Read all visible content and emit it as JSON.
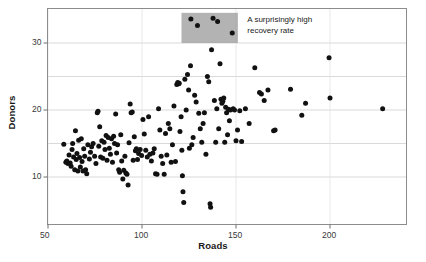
{
  "chart_data": {
    "type": "scatter",
    "title": "",
    "xlabel": "Roads",
    "ylabel": "Donors",
    "xlim": [
      48,
      238
    ],
    "ylim": [
      5,
      34.5
    ],
    "xticks": [
      50,
      100,
      150,
      200
    ],
    "yticks": [
      10,
      20,
      30
    ],
    "gridlines_y": [
      10,
      15,
      20,
      25,
      30
    ],
    "grid": true,
    "legend": "none",
    "marker_color": "#111111",
    "marker_size": 2.5,
    "annotations": [
      {
        "name": "highlight-band",
        "type": "rect",
        "x0": 121,
        "x1": 151,
        "y0": 30,
        "y1": 34.5,
        "fill": "#9a9a9a",
        "opacity": 0.75
      },
      {
        "name": "highlight-note",
        "type": "text",
        "line1": "A surprisingly high",
        "line2": "recovery rate",
        "x": 156,
        "y": 33.6
      }
    ],
    "points": [
      [
        58.4,
        14.9
      ],
      [
        59.5,
        12.2
      ],
      [
        60.0,
        12.4
      ],
      [
        60.6,
        12.0
      ],
      [
        61.2,
        13.3
      ],
      [
        61.8,
        12.1
      ],
      [
        62.3,
        11.6
      ],
      [
        62.8,
        14.1
      ],
      [
        63.1,
        15.0
      ],
      [
        63.6,
        13.0
      ],
      [
        64.2,
        11.1
      ],
      [
        64.6,
        16.9
      ],
      [
        65.0,
        12.6
      ],
      [
        65.4,
        13.5
      ],
      [
        65.9,
        10.9
      ],
      [
        66.3,
        15.5
      ],
      [
        66.8,
        12.9
      ],
      [
        67.2,
        11.5
      ],
      [
        67.7,
        15.7
      ],
      [
        68.1,
        12.3
      ],
      [
        68.6,
        10.9
      ],
      [
        69.0,
        14.2
      ],
      [
        69.5,
        13.1
      ],
      [
        70.0,
        11.1
      ],
      [
        70.6,
        10.5
      ],
      [
        71.2,
        14.8
      ],
      [
        72.0,
        12.7
      ],
      [
        72.6,
        13.7
      ],
      [
        73.2,
        14.5
      ],
      [
        74.0,
        15.0
      ],
      [
        74.8,
        13.1
      ],
      [
        75.5,
        12.0
      ],
      [
        76.2,
        19.6
      ],
      [
        76.6,
        19.8
      ],
      [
        77.0,
        14.6
      ],
      [
        77.5,
        17.5
      ],
      [
        78.0,
        13.0
      ],
      [
        78.6,
        15.4
      ],
      [
        79.2,
        12.8
      ],
      [
        79.8,
        15.2
      ],
      [
        80.3,
        14.1
      ],
      [
        80.9,
        16.2
      ],
      [
        81.4,
        12.5
      ],
      [
        82.0,
        15.9
      ],
      [
        82.6,
        14.3
      ],
      [
        83.2,
        13.4
      ],
      [
        83.8,
        15.7
      ],
      [
        84.3,
        12.2
      ],
      [
        84.9,
        16.1
      ],
      [
        85.4,
        15.0
      ],
      [
        86.0,
        19.4
      ],
      [
        86.5,
        13.6
      ],
      [
        87.0,
        14.8
      ],
      [
        87.6,
        11.1
      ],
      [
        88.1,
        10.7
      ],
      [
        88.7,
        16.3
      ],
      [
        89.2,
        12.4
      ],
      [
        89.8,
        9.7
      ],
      [
        90.3,
        11.0
      ],
      [
        90.9,
        13.1
      ],
      [
        91.4,
        10.6
      ],
      [
        92.0,
        10.4
      ],
      [
        92.6,
        8.8
      ],
      [
        93.1,
        15.1
      ],
      [
        93.7,
        20.9
      ],
      [
        94.2,
        19.6
      ],
      [
        94.8,
        19.7
      ],
      [
        95.3,
        12.5
      ],
      [
        95.9,
        16.0
      ],
      [
        96.5,
        13.9
      ],
      [
        97.0,
        14.2
      ],
      [
        97.6,
        12.6
      ],
      [
        98.2,
        13.5
      ],
      [
        99.0,
        14.1
      ],
      [
        99.8,
        13.2
      ],
      [
        100.5,
        18.6
      ],
      [
        101.2,
        16.4
      ],
      [
        102.0,
        14.0
      ],
      [
        102.8,
        13.0
      ],
      [
        103.5,
        19.0
      ],
      [
        104.2,
        13.4
      ],
      [
        105.0,
        12.4
      ],
      [
        105.8,
        13.6
      ],
      [
        106.5,
        14.2
      ],
      [
        107.2,
        10.5
      ],
      [
        108.0,
        10.4
      ],
      [
        108.8,
        20.2
      ],
      [
        109.5,
        17.0
      ],
      [
        110.2,
        13.1
      ],
      [
        111.0,
        12.0
      ],
      [
        111.8,
        10.4
      ],
      [
        112.5,
        16.5
      ],
      [
        113.2,
        13.3
      ],
      [
        114.0,
        18.0
      ],
      [
        114.8,
        17.2
      ],
      [
        115.5,
        12.2
      ],
      [
        116.2,
        14.8
      ],
      [
        117.0,
        20.6
      ],
      [
        117.8,
        12.3
      ],
      [
        118.5,
        23.8
      ],
      [
        119.0,
        24.1
      ],
      [
        119.5,
        23.9
      ],
      [
        119.8,
        24.0
      ],
      [
        120.2,
        16.8
      ],
      [
        120.8,
        19.0
      ],
      [
        121.2,
        14.0
      ],
      [
        121.5,
        10.2
      ],
      [
        121.8,
        7.8
      ],
      [
        122.2,
        6.2
      ],
      [
        122.8,
        24.6
      ],
      [
        123.5,
        20.0
      ],
      [
        124.2,
        25.3
      ],
      [
        124.8,
        23.0
      ],
      [
        125.2,
        14.3
      ],
      [
        125.8,
        26.6
      ],
      [
        126.0,
        33.6
      ],
      [
        126.5,
        14.8
      ],
      [
        127.2,
        15.9
      ],
      [
        128.0,
        22.2
      ],
      [
        128.8,
        21.2
      ],
      [
        129.5,
        32.6
      ],
      [
        130.2,
        19.5
      ],
      [
        131.0,
        17.2
      ],
      [
        131.8,
        15.2
      ],
      [
        132.5,
        18.0
      ],
      [
        133.2,
        19.6
      ],
      [
        134.0,
        13.4
      ],
      [
        134.8,
        25.0
      ],
      [
        135.5,
        24.2
      ],
      [
        136.2,
        6.0
      ],
      [
        136.5,
        5.5
      ],
      [
        137.0,
        29.0
      ],
      [
        137.8,
        33.7
      ],
      [
        138.5,
        21.4
      ],
      [
        139.2,
        15.2
      ],
      [
        139.8,
        20.2
      ],
      [
        140.2,
        33.2
      ],
      [
        140.8,
        17.2
      ],
      [
        141.5,
        26.9
      ],
      [
        142.0,
        21.6
      ],
      [
        142.5,
        21.0
      ],
      [
        143.0,
        21.3
      ],
      [
        143.5,
        21.8
      ],
      [
        144.0,
        15.2
      ],
      [
        144.5,
        20.4
      ],
      [
        145.0,
        19.6
      ],
      [
        145.5,
        16.3
      ],
      [
        146.0,
        20.1
      ],
      [
        146.5,
        18.4
      ],
      [
        147.0,
        20.0
      ],
      [
        148.0,
        31.5
      ],
      [
        148.5,
        20.2
      ],
      [
        149.2,
        20.0
      ],
      [
        150.0,
        15.4
      ],
      [
        150.8,
        17.0
      ],
      [
        152.0,
        19.9
      ],
      [
        153.0,
        15.3
      ],
      [
        155.0,
        20.2
      ],
      [
        157.0,
        18.0
      ],
      [
        160.0,
        26.3
      ],
      [
        162.5,
        22.6
      ],
      [
        163.5,
        22.4
      ],
      [
        165.0,
        21.4
      ],
      [
        167.0,
        23.0
      ],
      [
        170.0,
        16.9
      ],
      [
        170.8,
        17.0
      ],
      [
        179.0,
        23.1
      ],
      [
        185.0,
        19.2
      ],
      [
        187.0,
        21.0
      ],
      [
        199.5,
        27.8
      ],
      [
        200.0,
        21.8
      ],
      [
        228.0,
        20.2
      ]
    ]
  },
  "axes": {
    "xtick_labels": [
      "50",
      "100",
      "150",
      "200"
    ],
    "ytick_labels": [
      "10",
      "20",
      "30"
    ]
  }
}
